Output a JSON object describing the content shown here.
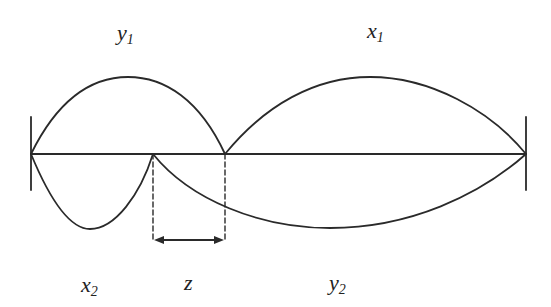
{
  "labels": {
    "y1": {
      "base": "y",
      "sub": "1"
    },
    "x1": {
      "base": "x",
      "sub": "1"
    },
    "x2": {
      "base": "x",
      "sub": "2"
    },
    "z": {
      "base": "z",
      "sub": ""
    },
    "y2": {
      "base": "y",
      "sub": "2"
    }
  },
  "colors": {
    "stroke": "#2a2a2a",
    "background": "#ffffff"
  }
}
